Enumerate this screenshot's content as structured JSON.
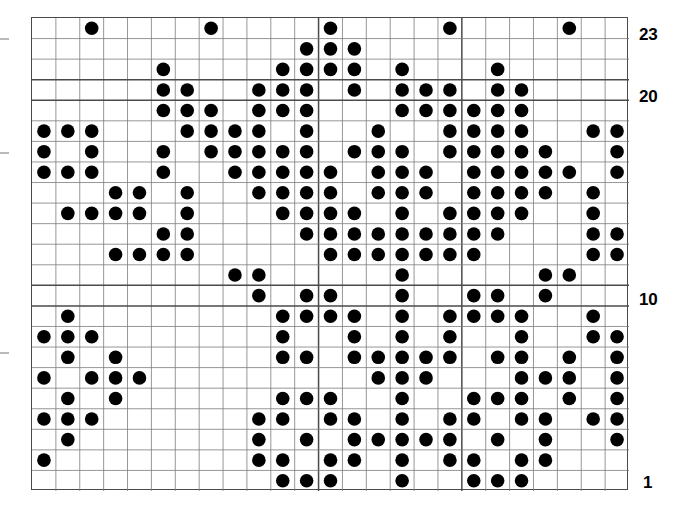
{
  "chart_data": {
    "type": "heatmap",
    "title": "",
    "xlabel": "",
    "ylabel": "",
    "grid": true,
    "legend": null,
    "columns": 25,
    "rows": 23,
    "row_labels_shown": [
      "23",
      "20",
      "10",
      "1"
    ],
    "row_label_values": [
      23,
      20,
      10,
      1
    ],
    "dot_color": "#000000",
    "grid_line_color": "#7c7c7c",
    "major_grid_line_color": "#4a4a4a",
    "border_color": "#4a4a4a",
    "background_color": "#ffffff",
    "major_row_lines_after": [
      20,
      10
    ],
    "major_col_lines_after": [
      12,
      18
    ],
    "x": [
      1,
      2,
      3,
      4,
      5,
      6,
      7,
      8,
      9,
      10,
      11,
      12,
      13,
      14,
      15,
      16,
      17,
      18,
      19,
      20,
      21,
      22,
      23,
      24,
      25
    ],
    "matrix_note": "Each entry of rows[] lists the 1-indexed column numbers containing a dot, for the row whose label is given.",
    "rows_data": [
      {
        "row": 23,
        "cols": [
          3,
          8,
          13,
          18,
          23
        ]
      },
      {
        "row": 22,
        "cols": [
          12,
          13,
          14
        ]
      },
      {
        "row": 21,
        "cols": [
          6,
          11,
          12,
          13,
          14,
          16,
          20
        ]
      },
      {
        "row": 20,
        "cols": [
          6,
          7,
          10,
          11,
          12,
          14,
          16,
          17,
          18,
          20,
          21
        ]
      },
      {
        "row": 19,
        "cols": [
          6,
          7,
          8,
          10,
          11,
          12,
          16,
          17,
          18,
          19,
          20,
          21
        ]
      },
      {
        "row": 18,
        "cols": [
          1,
          2,
          3,
          7,
          8,
          9,
          10,
          12,
          15,
          18,
          19,
          20,
          21,
          24,
          25
        ]
      },
      {
        "row": 17,
        "cols": [
          1,
          3,
          6,
          8,
          9,
          10,
          11,
          12,
          14,
          15,
          16,
          18,
          19,
          20,
          21,
          22,
          25
        ]
      },
      {
        "row": 16,
        "cols": [
          1,
          2,
          3,
          6,
          9,
          10,
          11,
          12,
          13,
          15,
          16,
          17,
          19,
          20,
          21,
          22,
          23,
          25
        ]
      },
      {
        "row": 15,
        "cols": [
          4,
          5,
          7,
          10,
          11,
          12,
          13,
          15,
          16,
          17,
          19,
          20,
          21,
          22,
          24,
          26
        ]
      },
      {
        "row": 14,
        "cols": [
          2,
          3,
          4,
          5,
          7,
          11,
          12,
          13,
          14,
          16,
          18,
          19,
          20,
          21,
          24,
          26,
          27,
          28
        ]
      },
      {
        "row": 13,
        "cols": [
          6,
          7,
          12,
          13,
          14,
          15,
          16,
          17,
          18,
          19,
          20,
          24,
          25
        ]
      },
      {
        "row": 12,
        "cols": [
          4,
          5,
          6,
          7,
          13,
          14,
          15,
          16,
          17,
          18,
          19,
          24,
          25,
          26,
          27
        ]
      },
      {
        "row": 11,
        "cols": [
          9,
          10,
          16,
          22,
          23
        ]
      },
      {
        "row": 10,
        "cols": [
          10,
          12,
          13,
          16,
          19,
          20,
          22
        ]
      },
      {
        "row": 9,
        "cols": [
          2,
          11,
          12,
          13,
          14,
          16,
          18,
          19,
          20,
          21,
          24
        ]
      },
      {
        "row": 8,
        "cols": [
          1,
          2,
          3,
          11,
          14,
          16,
          18,
          21,
          24,
          25,
          26
        ]
      },
      {
        "row": 7,
        "cols": [
          2,
          4,
          11,
          12,
          14,
          15,
          16,
          17,
          18,
          20,
          21,
          23,
          25,
          27
        ]
      },
      {
        "row": 6,
        "cols": [
          1,
          3,
          4,
          5,
          15,
          16,
          17,
          21,
          22,
          23,
          25,
          26
        ]
      },
      {
        "row": 5,
        "cols": [
          2,
          4,
          11,
          12,
          13,
          16,
          19,
          20,
          21,
          23,
          25,
          27
        ]
      },
      {
        "row": 4,
        "cols": [
          1,
          2,
          3,
          10,
          11,
          13,
          14,
          16,
          18,
          19,
          21,
          22,
          24,
          25,
          26
        ]
      },
      {
        "row": 3,
        "cols": [
          2,
          10,
          12,
          14,
          15,
          16,
          17,
          18,
          20,
          22,
          25,
          27
        ]
      },
      {
        "row": 2,
        "cols": [
          1,
          10,
          11,
          13,
          14,
          16,
          18,
          19,
          21,
          22,
          26,
          27
        ]
      },
      {
        "row": 1,
        "cols": [
          11,
          12,
          13,
          16,
          19,
          20,
          21,
          27
        ]
      }
    ]
  },
  "axis": {
    "labels": [
      {
        "text": "23",
        "row": 23
      },
      {
        "text": "20",
        "row": 20
      },
      {
        "text": "10",
        "row": 10
      },
      {
        "text": "1",
        "row": 1
      }
    ],
    "label_23": "23",
    "label_20": "20",
    "label_10": "10",
    "label_1": "1"
  }
}
